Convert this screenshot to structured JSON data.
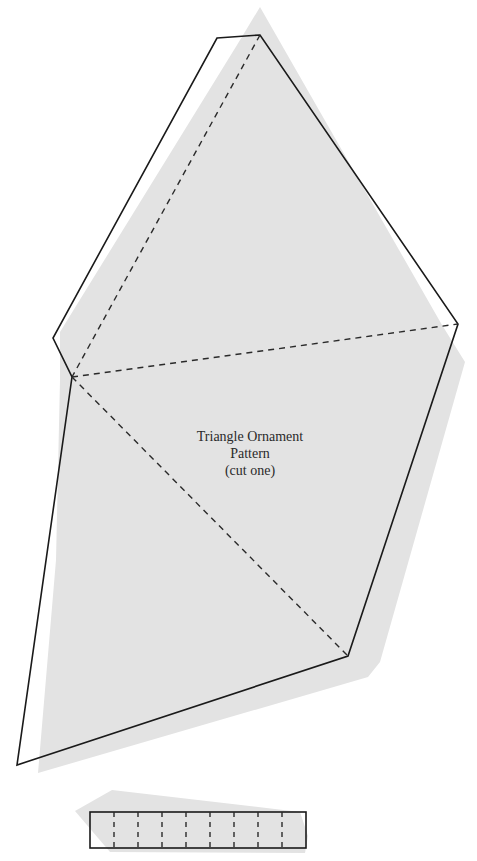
{
  "pattern": {
    "title": "Triangle Ornament",
    "subtitle": "Pattern",
    "note": "(cut one)"
  },
  "colors": {
    "background": "#ffffff",
    "shadow_fill": "#e3e3e3",
    "outline": "#1a1a1a",
    "fold_line": "#2a2a2a"
  },
  "legend": {
    "solid_line": "cut line",
    "dashed_line": "fold line"
  },
  "strip": {
    "segments": 9,
    "dashed_dividers": 9
  }
}
